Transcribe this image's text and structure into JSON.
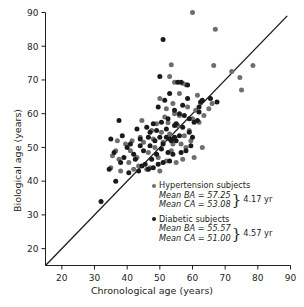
{
  "axes": {
    "x": {
      "label": "Chronological age (years)",
      "ticks": [
        20,
        30,
        40,
        50,
        60,
        70,
        80,
        90
      ],
      "min": 15,
      "max": 90
    },
    "y": {
      "label": "Biological age (years)",
      "ticks": [
        20,
        30,
        40,
        50,
        60,
        70,
        80,
        90
      ],
      "min": 15,
      "max": 90
    }
  },
  "legend": {
    "hypertension": {
      "marker_color": "#6e6e6e",
      "title": "Hypertension subjects",
      "mean_ba": "Mean BA = 57.25",
      "mean_ca": "Mean CA = 53.08",
      "delta": "4.17 yr"
    },
    "diabetic": {
      "marker_color": "#1a1a1a",
      "title": "Diabetic subjects",
      "mean_ba": "Mean BA = 55.57",
      "mean_ca": "Mean CA = 51.00",
      "delta": "4.57 yr"
    }
  },
  "chart_data": {
    "type": "scatter",
    "title": "",
    "xlabel": "Chronological age (years)",
    "ylabel": "Biological age (years)",
    "xlim": [
      15,
      90
    ],
    "ylim": [
      15,
      90
    ],
    "grid": false,
    "legend_position": "inside-lower-right",
    "reference_line": {
      "name": "identity-line",
      "equation": "y = x",
      "from": [
        15,
        15
      ],
      "to": [
        89,
        89
      ],
      "color": "#1a1a1a"
    },
    "series": [
      {
        "name": "Hypertension subjects",
        "color": "#6e6e6e",
        "marker": "circle",
        "mean_ba": 57.25,
        "mean_ca": 53.08,
        "mean_difference": 4.17,
        "points": [
          [
            60.0,
            90.0
          ],
          [
            67.0,
            85.0
          ],
          [
            53.5,
            74.5
          ],
          [
            66.5,
            74.3
          ],
          [
            78.5,
            74.3
          ],
          [
            74.5,
            70.7
          ],
          [
            53.0,
            71.0
          ],
          [
            54.5,
            69.3
          ],
          [
            57.0,
            69.0
          ],
          [
            58.0,
            68.6
          ],
          [
            75.0,
            67.0
          ],
          [
            50.0,
            64.5
          ],
          [
            62.5,
            63.3
          ],
          [
            66.0,
            63.0
          ],
          [
            54.0,
            63.0
          ],
          [
            52.0,
            61.5
          ],
          [
            58.5,
            62.0
          ],
          [
            61.0,
            61.0
          ],
          [
            44.5,
            58.0
          ],
          [
            56.0,
            59.5
          ],
          [
            60.0,
            58.5
          ],
          [
            49.0,
            57.0
          ],
          [
            52.5,
            57.3
          ],
          [
            55.5,
            56.5
          ],
          [
            62.0,
            57.5
          ],
          [
            47.5,
            55.0
          ],
          [
            50.5,
            54.5
          ],
          [
            53.0,
            54.0
          ],
          [
            57.5,
            53.5
          ],
          [
            59.5,
            52.0
          ],
          [
            37.0,
            52.0
          ],
          [
            39.5,
            51.0
          ],
          [
            41.0,
            49.0
          ],
          [
            45.0,
            51.5
          ],
          [
            48.0,
            52.5
          ],
          [
            51.0,
            51.5
          ],
          [
            54.0,
            51.0
          ],
          [
            56.5,
            51.0
          ],
          [
            58.0,
            50.0
          ],
          [
            63.0,
            50.0
          ],
          [
            35.5,
            47.5
          ],
          [
            37.5,
            46.5
          ],
          [
            40.5,
            45.5
          ],
          [
            43.0,
            47.0
          ],
          [
            46.5,
            48.5
          ],
          [
            49.5,
            47.0
          ],
          [
            52.0,
            46.0
          ],
          [
            55.0,
            45.5
          ],
          [
            57.0,
            46.5
          ],
          [
            60.5,
            47.0
          ],
          [
            35.0,
            44.0
          ],
          [
            38.0,
            43.0
          ],
          [
            42.0,
            43.5
          ],
          [
            47.0,
            44.0
          ],
          [
            50.0,
            43.0
          ],
          [
            53.5,
            49.0
          ],
          [
            48.5,
            50.0
          ],
          [
            44.0,
            53.0
          ],
          [
            51.5,
            59.0
          ],
          [
            46.0,
            43.5
          ],
          [
            59.0,
            55.0
          ],
          [
            63.5,
            59.5
          ],
          [
            65.0,
            61.5
          ],
          [
            72.0,
            72.5
          ],
          [
            36.5,
            49.0
          ],
          [
            41.5,
            52.0
          ],
          [
            43.5,
            44.5
          ],
          [
            54.5,
            60.0
          ],
          [
            56.0,
            66.0
          ],
          [
            61.5,
            65.5
          ]
        ]
      },
      {
        "name": "Diabetic subjects",
        "color": "#1a1a1a",
        "marker": "circle",
        "mean_ba": 55.57,
        "mean_ca": 51.0,
        "mean_difference": 4.57,
        "points": [
          [
            51.0,
            82.0
          ],
          [
            50.0,
            71.0
          ],
          [
            55.5,
            69.3
          ],
          [
            56.5,
            69.3
          ],
          [
            58.5,
            68.5
          ],
          [
            67.5,
            63.5
          ],
          [
            62.5,
            63.5
          ],
          [
            62.0,
            62.0
          ],
          [
            53.0,
            66.0
          ],
          [
            51.5,
            64.0
          ],
          [
            49.5,
            62.0
          ],
          [
            54.5,
            61.0
          ],
          [
            56.0,
            60.0
          ],
          [
            57.5,
            59.5
          ],
          [
            59.0,
            58.5
          ],
          [
            37.5,
            58.0
          ],
          [
            43.0,
            55.5
          ],
          [
            46.0,
            56.0
          ],
          [
            48.0,
            57.0
          ],
          [
            50.5,
            57.5
          ],
          [
            52.5,
            58.5
          ],
          [
            55.0,
            57.0
          ],
          [
            57.0,
            56.0
          ],
          [
            60.5,
            57.5
          ],
          [
            61.5,
            58.0
          ],
          [
            35.0,
            52.5
          ],
          [
            38.5,
            53.5
          ],
          [
            41.0,
            51.0
          ],
          [
            44.0,
            52.5
          ],
          [
            46.5,
            53.0
          ],
          [
            48.5,
            52.0
          ],
          [
            50.0,
            53.0
          ],
          [
            52.0,
            53.0
          ],
          [
            53.0,
            52.5
          ],
          [
            53.5,
            52.0
          ],
          [
            54.0,
            52.5
          ],
          [
            54.5,
            53.0
          ],
          [
            55.0,
            52.0
          ],
          [
            56.0,
            53.5
          ],
          [
            51.0,
            51.0
          ],
          [
            36.0,
            48.5
          ],
          [
            39.0,
            47.0
          ],
          [
            40.0,
            50.0
          ],
          [
            42.5,
            46.5
          ],
          [
            45.0,
            49.0
          ],
          [
            47.0,
            50.5
          ],
          [
            49.0,
            48.0
          ],
          [
            50.5,
            49.5
          ],
          [
            52.5,
            48.5
          ],
          [
            54.0,
            48.0
          ],
          [
            56.5,
            48.5
          ],
          [
            58.0,
            49.0
          ],
          [
            59.5,
            50.5
          ],
          [
            32.0,
            34.0
          ],
          [
            36.5,
            40.0
          ],
          [
            40.5,
            42.5
          ],
          [
            43.5,
            43.0
          ],
          [
            44.5,
            44.5
          ],
          [
            46.5,
            43.5
          ],
          [
            48.0,
            44.0
          ],
          [
            49.5,
            45.0
          ],
          [
            51.0,
            45.5
          ],
          [
            53.0,
            46.0
          ],
          [
            47.5,
            46.5
          ],
          [
            45.5,
            45.0
          ],
          [
            62.0,
            60.5
          ],
          [
            63.0,
            64.0
          ],
          [
            65.5,
            64.5
          ],
          [
            59.0,
            54.5
          ],
          [
            60.0,
            53.0
          ],
          [
            34.5,
            43.5
          ],
          [
            38.0,
            45.5
          ],
          [
            42.0,
            48.0
          ],
          [
            44.0,
            50.5
          ],
          [
            47.0,
            54.5
          ],
          [
            49.0,
            55.0
          ],
          [
            52.0,
            55.5
          ],
          [
            54.5,
            56.5
          ],
          [
            57.0,
            62.5
          ],
          [
            58.5,
            64.5
          ]
        ]
      }
    ]
  }
}
